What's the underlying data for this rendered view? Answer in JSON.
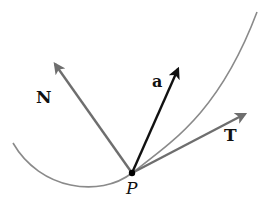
{
  "diagram": {
    "colors": {
      "curve": "#8a8a8a",
      "tangent": "#6e6e6e",
      "normal": "#6e6e6e",
      "acceleration": "#111111",
      "point": "#000000",
      "text": "#111111"
    },
    "point": {
      "label": "P",
      "x": 132,
      "y": 173
    },
    "curve": {
      "path": "M 13 143 C 40 190, 100 198, 132 173 C 175 140, 220 110, 257 12"
    },
    "vectors": [
      {
        "id": "N",
        "label": "N",
        "style": "bold",
        "x1": 132,
        "y1": 173,
        "x2": 55,
        "y2": 64,
        "label_x": 36,
        "label_y": 103
      },
      {
        "id": "a",
        "label": "a",
        "style": "bold",
        "x1": 132,
        "y1": 173,
        "x2": 178,
        "y2": 69,
        "label_x": 152,
        "label_y": 87
      },
      {
        "id": "T",
        "label": "T",
        "style": "bold",
        "x1": 132,
        "y1": 173,
        "x2": 245,
        "y2": 114,
        "label_x": 224,
        "label_y": 141
      }
    ]
  }
}
